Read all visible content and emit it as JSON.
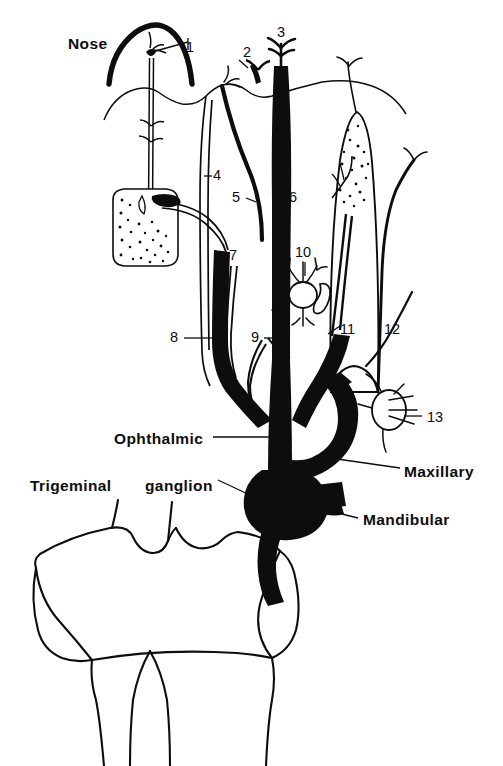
{
  "figure": {
    "kind": "anatomical-line-diagram",
    "background_color": "#ffffff",
    "ink_color": "#0d0d0d"
  },
  "word_labels": [
    {
      "id": "nose",
      "text": "Nose",
      "x": 68,
      "y": 36,
      "leader": true
    },
    {
      "id": "ophthalmic",
      "text": "Ophthalmic",
      "x": 114,
      "y": 431,
      "leader": true
    },
    {
      "id": "trigeminal",
      "text": "Trigeminal",
      "x": 30,
      "y": 478,
      "leader": false
    },
    {
      "id": "ganglion",
      "text": "ganglion",
      "x": 145,
      "y": 478,
      "leader": true
    },
    {
      "id": "maxillary",
      "text": "Maxillary",
      "x": 404,
      "y": 464,
      "leader": true
    },
    {
      "id": "mandibular",
      "text": "Mandibular",
      "x": 363,
      "y": 512,
      "leader": true
    }
  ],
  "number_labels": [
    {
      "id": "1",
      "text": "1",
      "x": 186,
      "y": 48
    },
    {
      "id": "2",
      "text": "2",
      "x": 243,
      "y": 52
    },
    {
      "id": "3",
      "text": "3",
      "x": 279,
      "y": 32
    },
    {
      "id": "4",
      "text": "4",
      "x": 212,
      "y": 170
    },
    {
      "id": "5",
      "text": "5",
      "x": 234,
      "y": 195
    },
    {
      "id": "6",
      "text": "6",
      "x": 288,
      "y": 195
    },
    {
      "id": "7",
      "text": "7",
      "x": 231,
      "y": 253
    },
    {
      "id": "8",
      "text": "8",
      "x": 173,
      "y": 332
    },
    {
      "id": "9",
      "text": "9",
      "x": 253,
      "y": 332
    },
    {
      "id": "10",
      "text": "10",
      "x": 297,
      "y": 251
    },
    {
      "id": "11",
      "text": "11",
      "x": 338,
      "y": 328
    },
    {
      "id": "12",
      "text": "12",
      "x": 388,
      "y": 328
    },
    {
      "id": "13",
      "text": "13",
      "x": 426,
      "y": 416
    }
  ],
  "structures": [
    {
      "id": "nose-arch",
      "name": "nose outline (thick arch)"
    },
    {
      "id": "facial-skin-contour",
      "name": "skin/face contour line"
    },
    {
      "id": "stippled-gland",
      "name": "stippled gland (lacrimal/olfactory organ)"
    },
    {
      "id": "tongue-taste-bud",
      "name": "tongue with stippled taste region"
    },
    {
      "id": "ganglion-cell-10",
      "name": "autonomic ganglion cell cluster"
    },
    {
      "id": "sensory-corpuscle-13",
      "name": "sensory corpuscle with radiating fibres"
    },
    {
      "id": "ophthalmic-division",
      "name": "ophthalmic division trunk (filled black)"
    },
    {
      "id": "maxillary-division",
      "name": "maxillary division trunk (filled black)"
    },
    {
      "id": "mandibular-division",
      "name": "mandibular division trunk (filled black)"
    },
    {
      "id": "trigeminal-ganglion",
      "name": "trigeminal ganglion mass (filled black)"
    },
    {
      "id": "brainstem",
      "name": "brainstem / pons and medulla outline"
    }
  ]
}
